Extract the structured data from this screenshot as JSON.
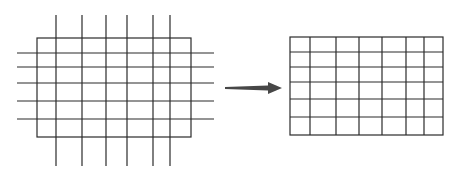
{
  "diagram": {
    "colors": {
      "line": "#2b2b2b",
      "arrow": "#474747",
      "background": "#ffffff"
    },
    "before": {
      "rect": {
        "x1": 37,
        "y1": 38,
        "x2": 191,
        "y2": 137
      },
      "vertical_lines_x": [
        56,
        82,
        106,
        127,
        153,
        170
      ],
      "vertical_extent": {
        "y1": 15,
        "y2": 166
      },
      "horizontal_lines_y": [
        53,
        67,
        83,
        101,
        119
      ],
      "horizontal_extent": {
        "x1": 17,
        "x2": 214
      }
    },
    "arrow": {
      "x1": 225,
      "y1": 88,
      "x2": 282,
      "y2": 88,
      "direction": "right"
    },
    "after": {
      "rect": {
        "x1": 290,
        "y1": 37,
        "x2": 443,
        "y2": 135
      },
      "vertical_lines_x": [
        310,
        336,
        359,
        382,
        406,
        424
      ],
      "horizontal_lines_y": [
        52,
        67,
        82,
        99,
        117
      ]
    }
  }
}
